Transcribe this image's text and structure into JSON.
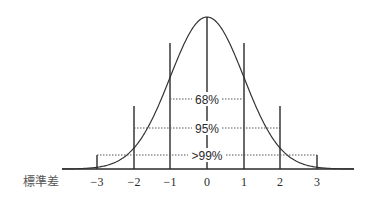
{
  "diagram": {
    "title": "",
    "axis_label": "標準差",
    "ticks": [
      "−3",
      "−2",
      "−1",
      "0",
      "1",
      "2",
      "3"
    ],
    "bands": [
      {
        "label": "68%",
        "range": "±1"
      },
      {
        "label": "95%",
        "range": "±2"
      },
      {
        "label": ">99%",
        "range": "±3"
      }
    ],
    "colors": {
      "line": "#2a2a2a",
      "dotted": "#555555",
      "text": "#2a2a2a"
    }
  }
}
